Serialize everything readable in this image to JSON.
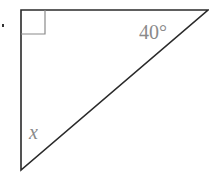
{
  "diagram": {
    "type": "right-triangle",
    "angles": {
      "right_angle_marker": "top-left",
      "top_right_angle": "40°",
      "bottom_angle": "x"
    },
    "colors": {
      "stroke": "#2a2a2a",
      "marker": "#8a8a8a",
      "label": "#8a8a8a"
    }
  }
}
